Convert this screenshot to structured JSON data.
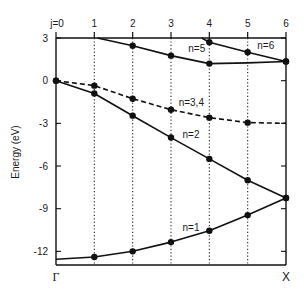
{
  "chart_data": {
    "type": "line",
    "title": "",
    "xlabel": "",
    "ylabel": "Energy (eV)",
    "ylim": [
      -12.96,
      3
    ],
    "xlim": [
      0,
      6
    ],
    "yticks": [
      3,
      0,
      -3,
      -6,
      -9,
      -12
    ],
    "ytick_labels": [
      "3",
      "0",
      "-3",
      "-6",
      "-9",
      "-12"
    ],
    "top_labels": [
      "j=0",
      "1",
      "2",
      "3",
      "4",
      "5",
      "6"
    ],
    "bottom_labels": {
      "left": "Γ",
      "right": "X"
    },
    "grid": "vertical dotted lines at j=1..5",
    "legend": "none (inline curve labels)",
    "x": [
      0,
      1,
      2,
      3,
      4,
      5,
      6
    ],
    "series": [
      {
        "name": "n=1",
        "style": "solid",
        "points": [
          [
            0,
            -12.55
          ],
          [
            1,
            -12.4
          ],
          [
            2,
            -12.0
          ],
          [
            3,
            -11.35
          ],
          [
            4,
            -10.55
          ],
          [
            5,
            -9.45
          ],
          [
            6,
            -8.25
          ]
        ],
        "markers": [
          1,
          2,
          3,
          4,
          5,
          6
        ]
      },
      {
        "name": "n=2",
        "style": "solid",
        "points": [
          [
            0,
            0
          ],
          [
            1,
            -0.9
          ],
          [
            2,
            -2.46
          ],
          [
            3,
            -4.0
          ],
          [
            4,
            -5.5
          ],
          [
            5,
            -7.0
          ],
          [
            6,
            -8.25
          ]
        ],
        "markers": [
          0,
          1,
          2,
          3,
          4,
          5,
          6
        ]
      },
      {
        "name": "n=3,4",
        "style": "dashed",
        "points": [
          [
            0,
            0
          ],
          [
            1,
            -0.35
          ],
          [
            2,
            -1.27
          ],
          [
            3,
            -2.04
          ],
          [
            4,
            -2.6
          ],
          [
            5,
            -2.95
          ],
          [
            6,
            -3.0
          ]
        ],
        "markers": [
          1,
          2,
          3,
          4,
          5
        ]
      },
      {
        "name": "n=5",
        "style": "solid",
        "points": [
          [
            1.08,
            3.0
          ],
          [
            2,
            2.45
          ],
          [
            3,
            1.76
          ],
          [
            4,
            1.2
          ],
          [
            5,
            1.25
          ],
          [
            6,
            1.35
          ]
        ],
        "markers": [
          2,
          3,
          4,
          6
        ]
      },
      {
        "name": "n=6",
        "style": "solid",
        "points": [
          [
            3.8,
            3.0
          ],
          [
            4,
            2.7
          ],
          [
            5,
            2.0
          ],
          [
            6,
            1.35
          ]
        ],
        "markers": [
          4,
          5,
          6
        ]
      }
    ],
    "annotations": [
      {
        "text": "n=1",
        "x": 3.3,
        "y": -10.6
      },
      {
        "text": "n=2",
        "x": 3.3,
        "y": -4.0
      },
      {
        "text": "n=3,4",
        "x": 3.2,
        "y": -1.8
      },
      {
        "text": "n=5",
        "x": 3.45,
        "y": 2.05
      },
      {
        "text": "n=6",
        "x": 5.25,
        "y": 2.2
      }
    ]
  }
}
